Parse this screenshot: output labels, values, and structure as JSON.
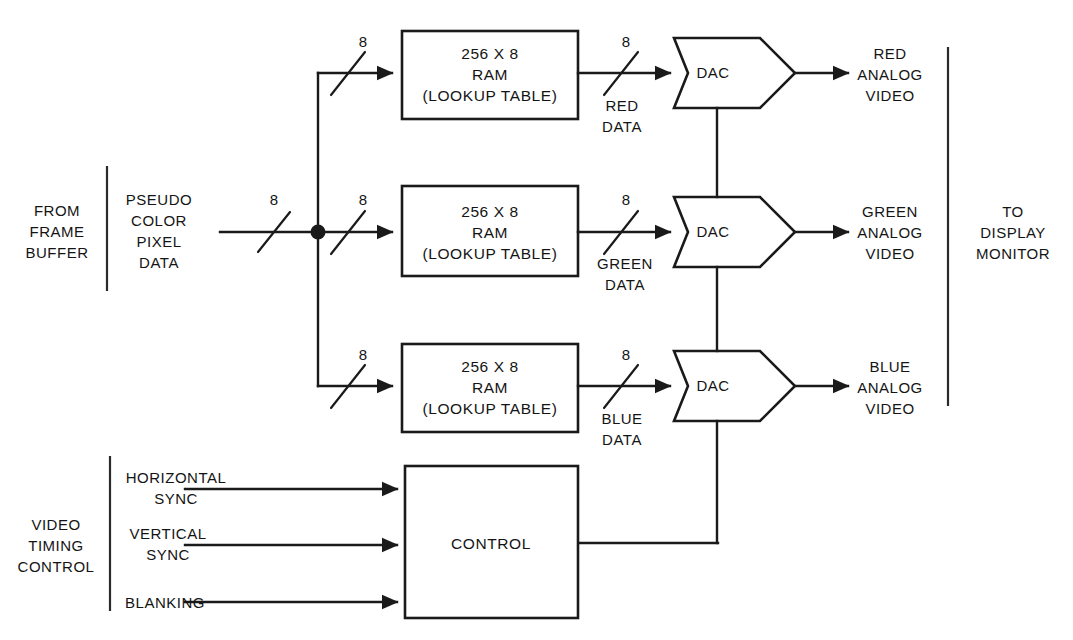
{
  "diagram": {
    "source_group": {
      "label": "FROM\nFRAME\nBUFFER",
      "signal_label": "PSEUDO\nCOLOR\nPIXEL\nDATA",
      "input_bus_width": "8",
      "branch_bus_widths": [
        "8",
        "8",
        "8"
      ]
    },
    "destination_group": {
      "label": "TO\nDISPLAY\nMONITOR"
    },
    "timing_group": {
      "label": "VIDEO\nTIMING\nCONTROL",
      "inputs": [
        {
          "name": "horizontal-sync",
          "label": "HORIZONTAL\nSYNC"
        },
        {
          "name": "vertical-sync",
          "label": "VERTICAL\nSYNC"
        },
        {
          "name": "blanking",
          "label": "BLANKING"
        }
      ]
    },
    "channels": [
      {
        "name": "red",
        "ram_label": "256 X 8\nRAM\n(LOOKUP TABLE)",
        "in_bus_width": "8",
        "out_bus_width": "8",
        "data_label": "RED\nDATA",
        "converter_label": "DAC",
        "output_label": "RED\nANALOG\nVIDEO"
      },
      {
        "name": "green",
        "ram_label": "256 X 8\nRAM\n(LOOKUP TABLE)",
        "in_bus_width": "8",
        "out_bus_width": "8",
        "data_label": "GREEN\nDATA",
        "converter_label": "DAC",
        "output_label": "GREEN\nANALOG\nVIDEO"
      },
      {
        "name": "blue",
        "ram_label": "256 X 8\nRAM\n(LOOKUP TABLE)",
        "in_bus_width": "8",
        "out_bus_width": "8",
        "data_label": "BLUE\nDATA",
        "converter_label": "DAC",
        "output_label": "BLUE\nANALOG\nVIDEO"
      }
    ],
    "control_block": {
      "label": "CONTROL"
    },
    "colors": {
      "line": "#1a1a1a",
      "text": "#141414",
      "background": "#ffffff"
    }
  }
}
